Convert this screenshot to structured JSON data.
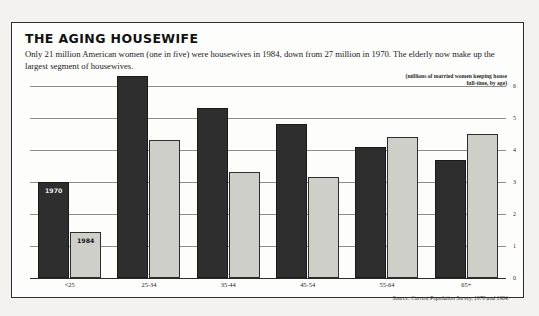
{
  "title": "THE AGING HOUSEWIFE",
  "subtitle": "Only 21 million American women (one in five) were housewives in 1984, down from 27 million in 1970.  The elderly now make up the largest segment of housewives.",
  "axis_note_line1": "(millions of married women keeping house",
  "axis_note_line2": "full-time, by age)",
  "source": "Source: Current Population Survey, 1970 and 1984.",
  "inline_tags": {
    "series_1970": "1970",
    "series_1984": "1984"
  },
  "chart_data": {
    "type": "bar",
    "title": "THE AGING HOUSEWIFE",
    "xlabel": "",
    "ylabel": "(millions of married women keeping house full-time, by age)",
    "ylim": [
      0,
      6
    ],
    "yticks": [
      0,
      1,
      2,
      3,
      4,
      5,
      6
    ],
    "ytick_labels": [
      "0",
      "1",
      "2",
      "3",
      "4",
      "5",
      "6"
    ],
    "grid": true,
    "legend_position": "in-plot-labels",
    "categories": [
      "<25",
      "25-34",
      "35-44",
      "45-54",
      "55-64",
      "65+"
    ],
    "series": [
      {
        "name": "1970",
        "color": "#2e2e2e",
        "values": [
          3.0,
          6.3,
          5.3,
          4.8,
          4.1,
          3.7
        ]
      },
      {
        "name": "1984",
        "color": "#cfcfc9",
        "values": [
          1.45,
          4.3,
          3.3,
          3.15,
          4.4,
          4.5
        ]
      }
    ]
  }
}
